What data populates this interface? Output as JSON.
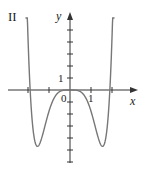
{
  "panel_label": "II",
  "chart_data": {
    "type": "line",
    "title": "II",
    "xlabel": "x",
    "ylabel": "y",
    "x_tick_labels": [
      "0",
      "1"
    ],
    "y_tick_labels": [
      "1"
    ],
    "xlim": [
      -2.95,
      3.15
    ],
    "ylim": [
      -6,
      6.4
    ],
    "grid": false,
    "legend": null,
    "series": [
      {
        "name": "curve",
        "x": [
          -2.1,
          -1.9,
          -1.55,
          -1.0,
          -0.5,
          0,
          0.5,
          1.0,
          1.55,
          1.9,
          2.1
        ],
        "y": [
          6.0,
          0,
          -4.7,
          -1.8,
          -0.15,
          0,
          -0.15,
          -1.8,
          -4.7,
          0,
          6.0
        ]
      }
    ]
  },
  "labels": {
    "panel": "II",
    "x_axis": "x",
    "y_axis": "y",
    "origin": "0",
    "x_one": "1",
    "y_one": "1"
  },
  "colors": {
    "curve": "#777777",
    "axis": "#333333"
  }
}
